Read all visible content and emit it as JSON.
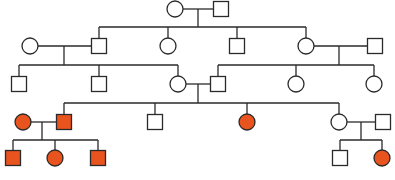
{
  "diagram": {
    "type": "pedigree-chart",
    "title": "",
    "colors": {
      "affected_fill": "#E8531E",
      "unaffected_fill": "#FFFFFF",
      "stroke": "#2A2A2A"
    },
    "legend": {
      "square": "male",
      "circle": "female",
      "filled": "affected",
      "open": "unaffected"
    },
    "individuals": [
      {
        "id": "I-1",
        "generation": 1,
        "sex": "female",
        "affected": false,
        "x": 175,
        "y": 9
      },
      {
        "id": "I-2",
        "generation": 1,
        "sex": "male",
        "affected": false,
        "x": 221,
        "y": 9
      },
      {
        "id": "II-1",
        "generation": 2,
        "sex": "female",
        "affected": false,
        "x": 30,
        "y": 46,
        "note": "spouse"
      },
      {
        "id": "II-2",
        "generation": 2,
        "sex": "male",
        "affected": false,
        "x": 99,
        "y": 46
      },
      {
        "id": "II-3",
        "generation": 2,
        "sex": "female",
        "affected": false,
        "x": 168,
        "y": 46
      },
      {
        "id": "II-4",
        "generation": 2,
        "sex": "male",
        "affected": false,
        "x": 237,
        "y": 46
      },
      {
        "id": "II-5",
        "generation": 2,
        "sex": "female",
        "affected": false,
        "x": 306,
        "y": 46
      },
      {
        "id": "II-6",
        "generation": 2,
        "sex": "male",
        "affected": false,
        "x": 375,
        "y": 46,
        "note": "spouse"
      },
      {
        "id": "III-1",
        "generation": 3,
        "sex": "male",
        "affected": false,
        "x": 19,
        "y": 84
      },
      {
        "id": "III-2",
        "generation": 3,
        "sex": "male",
        "affected": false,
        "x": 99,
        "y": 84
      },
      {
        "id": "III-3",
        "generation": 3,
        "sex": "female",
        "affected": false,
        "x": 178,
        "y": 84
      },
      {
        "id": "III-4",
        "generation": 3,
        "sex": "male",
        "affected": false,
        "x": 218,
        "y": 84
      },
      {
        "id": "III-5",
        "generation": 3,
        "sex": "female",
        "affected": false,
        "x": 296,
        "y": 84
      },
      {
        "id": "III-6",
        "generation": 3,
        "sex": "female",
        "affected": false,
        "x": 374,
        "y": 84
      },
      {
        "id": "IV-1",
        "generation": 4,
        "sex": "female",
        "affected": true,
        "x": 23,
        "y": 122,
        "note": "spouse"
      },
      {
        "id": "IV-2",
        "generation": 4,
        "sex": "male",
        "affected": true,
        "x": 64,
        "y": 122
      },
      {
        "id": "IV-3",
        "generation": 4,
        "sex": "male",
        "affected": false,
        "x": 155,
        "y": 122
      },
      {
        "id": "IV-4",
        "generation": 4,
        "sex": "female",
        "affected": true,
        "x": 247,
        "y": 122
      },
      {
        "id": "IV-5",
        "generation": 4,
        "sex": "female",
        "affected": false,
        "x": 339,
        "y": 122
      },
      {
        "id": "IV-6",
        "generation": 4,
        "sex": "male",
        "affected": false,
        "x": 383,
        "y": 122,
        "note": "spouse"
      },
      {
        "id": "V-1",
        "generation": 5,
        "sex": "male",
        "affected": true,
        "x": 13,
        "y": 158
      },
      {
        "id": "V-2",
        "generation": 5,
        "sex": "female",
        "affected": true,
        "x": 55,
        "y": 158
      },
      {
        "id": "V-3",
        "generation": 5,
        "sex": "male",
        "affected": true,
        "x": 98,
        "y": 158
      },
      {
        "id": "V-4",
        "generation": 5,
        "sex": "male",
        "affected": false,
        "x": 340,
        "y": 158
      },
      {
        "id": "V-5",
        "generation": 5,
        "sex": "female",
        "affected": true,
        "x": 382,
        "y": 158
      }
    ],
    "matings": [
      {
        "partners": [
          "I-1",
          "I-2"
        ],
        "children": [
          "II-2",
          "II-3",
          "II-4",
          "II-5"
        ]
      },
      {
        "partners": [
          "II-1",
          "II-2"
        ],
        "children": [
          "III-1",
          "III-2",
          "III-3"
        ]
      },
      {
        "partners": [
          "II-5",
          "II-6"
        ],
        "children": [
          "III-4",
          "III-5",
          "III-6"
        ]
      },
      {
        "partners": [
          "III-3",
          "III-4"
        ],
        "children": [
          "IV-2",
          "IV-3",
          "IV-4",
          "IV-5"
        ]
      },
      {
        "partners": [
          "IV-1",
          "IV-2"
        ],
        "children": [
          "V-1",
          "V-2",
          "V-3"
        ]
      },
      {
        "partners": [
          "IV-5",
          "IV-6"
        ],
        "children": [
          "V-4",
          "V-5"
        ]
      }
    ],
    "caption_partial": ""
  }
}
